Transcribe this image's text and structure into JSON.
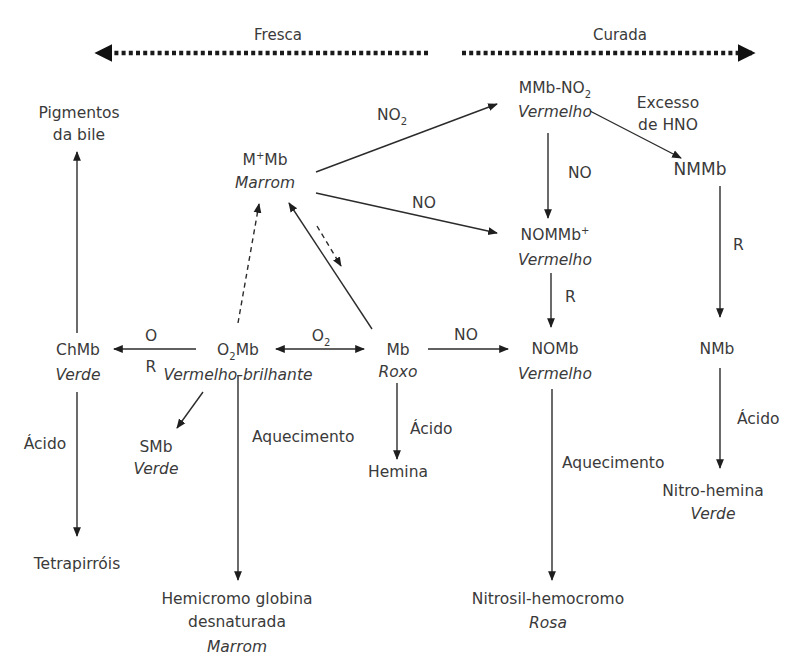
{
  "header": {
    "fresh_label": "Fresca",
    "cured_label": "Curada"
  },
  "nodes": {
    "bile_pigments": {
      "line1": "Pigmentos",
      "line2": "da bile"
    },
    "metmyoglobin": {
      "name_base": "M",
      "name_sup": "+",
      "name_rest": "Mb",
      "color": "Marrom"
    },
    "nitrometmyoglobin": {
      "name_base": "MMb-NO",
      "name_sub": "2",
      "color": "Vermelho"
    },
    "excess_hno": {
      "line1": "Excesso",
      "line2": "de HNO"
    },
    "nitrimetmyoglobin": {
      "name": "NMMb"
    },
    "nitrosylmetmyoglobin": {
      "name_base": "NOMMb",
      "name_sup": "+",
      "color": "Vermelho"
    },
    "cholemyoglobin": {
      "name": "ChMb",
      "color": "Verde"
    },
    "oxymyoglobin": {
      "name_base": "O",
      "name_sub": "2",
      "name_rest": "Mb",
      "color": "Vermelho-brilhante"
    },
    "myoglobin": {
      "name": "Mb",
      "color": "Roxo"
    },
    "nitrosylmyoglobin": {
      "name": "NOMb",
      "color": "Vermelho"
    },
    "nitrimyoglobin": {
      "name": "NMb"
    },
    "sulfmyoglobin": {
      "name": "SMb",
      "color": "Verde"
    },
    "hemin": {
      "name": "Hemina"
    },
    "tetrapyrroles": {
      "name": "Tetrapirróis"
    },
    "denatured_globin_hemichrome": {
      "line1": "Hemicromo globina",
      "line2": "desnaturada",
      "color": "Marrom"
    },
    "nitrosyl_hemochrome": {
      "name": "Nitrosil-hemocromo",
      "color": "Rosa"
    },
    "nitrohemin": {
      "name": "Nitro-hemina",
      "color": "Verde"
    }
  },
  "edges": {
    "mmb_to_mmbno2": {
      "label_base": "NO",
      "label_sub": "2"
    },
    "mmb_to_nommb": {
      "label": "NO"
    },
    "mmbno2_to_nommb": {
      "label": "NO"
    },
    "nommb_to_nomb": {
      "label": "R"
    },
    "nmmb_to_nmb": {
      "label": "R"
    },
    "o2mb_to_chmb_top": {
      "label": "O"
    },
    "o2mb_to_chmb_bottom": {
      "label": "R"
    },
    "o2mb_mb": {
      "label_base": "O",
      "label_sub": "2"
    },
    "mb_to_nomb": {
      "label": "NO"
    },
    "chmb_to_tetrapyrroles": {
      "label": "Ácido"
    },
    "o2mb_to_hemichrome": {
      "label": "Aquecimento"
    },
    "mb_to_hemin": {
      "label": "Ácido"
    },
    "nomb_to_nitrosyl_hemochrome": {
      "label": "Aquecimento"
    },
    "nmb_to_nitrohemin": {
      "label": "Ácido"
    }
  }
}
